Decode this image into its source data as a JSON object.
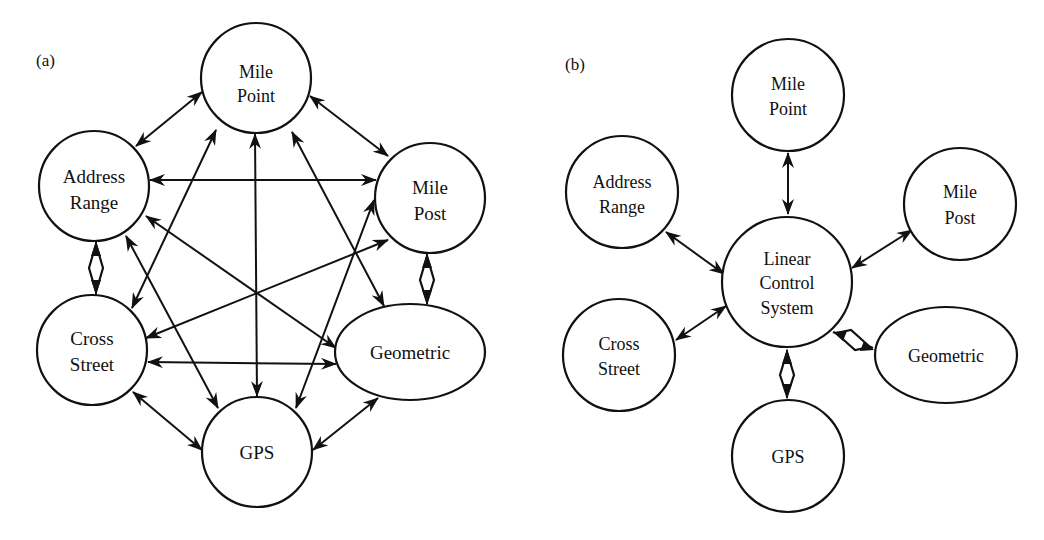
{
  "panels": [
    {
      "label": "(a)",
      "layout": "fully-connected",
      "nodes": [
        {
          "id": "mile_point",
          "lines": [
            "Mile",
            "Point"
          ],
          "shape": "circle"
        },
        {
          "id": "address_range",
          "lines": [
            "Address",
            "Range"
          ],
          "shape": "circle"
        },
        {
          "id": "mile_post",
          "lines": [
            "Mile",
            "Post"
          ],
          "shape": "circle"
        },
        {
          "id": "cross_street",
          "lines": [
            "Cross",
            "Street"
          ],
          "shape": "circle"
        },
        {
          "id": "geometric",
          "lines": [
            "Geometric"
          ],
          "shape": "ellipse"
        },
        {
          "id": "gps",
          "lines": [
            "GPS"
          ],
          "shape": "circle"
        }
      ],
      "edges": [
        [
          "address_range",
          "mile_point",
          "bidirectional"
        ],
        [
          "mile_point",
          "mile_post",
          "bidirectional"
        ],
        [
          "address_range",
          "mile_post",
          "bidirectional"
        ],
        [
          "address_range",
          "cross_street",
          "bidirectional-diamond"
        ],
        [
          "mile_post",
          "geometric",
          "bidirectional-diamond"
        ],
        [
          "cross_street",
          "gps",
          "bidirectional"
        ],
        [
          "geometric",
          "gps",
          "bidirectional"
        ],
        [
          "cross_street",
          "geometric",
          "bidirectional"
        ],
        [
          "mile_point",
          "gps",
          "bidirectional"
        ],
        [
          "mile_point",
          "cross_street",
          "bidirectional"
        ],
        [
          "mile_point",
          "geometric",
          "bidirectional"
        ],
        [
          "address_range",
          "gps",
          "bidirectional"
        ],
        [
          "address_range",
          "geometric",
          "bidirectional"
        ],
        [
          "mile_post",
          "cross_street",
          "bidirectional"
        ],
        [
          "mile_post",
          "gps",
          "bidirectional"
        ]
      ]
    },
    {
      "label": "(b)",
      "layout": "hub-and-spoke",
      "hub": {
        "id": "linear_control_system",
        "lines": [
          "Linear",
          "Control",
          "System"
        ],
        "shape": "circle"
      },
      "nodes": [
        {
          "id": "mile_point",
          "lines": [
            "Mile",
            "Point"
          ],
          "shape": "circle"
        },
        {
          "id": "address_range",
          "lines": [
            "Address",
            "Range"
          ],
          "shape": "circle"
        },
        {
          "id": "mile_post",
          "lines": [
            "Mile",
            "Post"
          ],
          "shape": "circle"
        },
        {
          "id": "cross_street",
          "lines": [
            "Cross",
            "Street"
          ],
          "shape": "circle"
        },
        {
          "id": "geometric",
          "lines": [
            "Geometric"
          ],
          "shape": "ellipse"
        },
        {
          "id": "gps",
          "lines": [
            "GPS"
          ],
          "shape": "circle"
        }
      ],
      "edges": [
        [
          "mile_point",
          "linear_control_system",
          "bidirectional"
        ],
        [
          "address_range",
          "linear_control_system",
          "bidirectional"
        ],
        [
          "mile_post",
          "linear_control_system",
          "bidirectional"
        ],
        [
          "cross_street",
          "linear_control_system",
          "bidirectional"
        ],
        [
          "geometric",
          "linear_control_system",
          "bidirectional-diamond"
        ],
        [
          "gps",
          "linear_control_system",
          "bidirectional-diamond"
        ]
      ]
    }
  ]
}
